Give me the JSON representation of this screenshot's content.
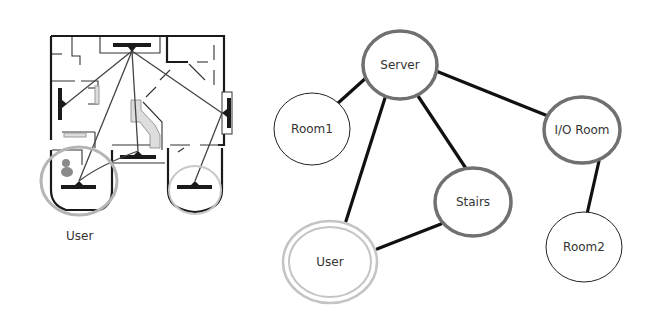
{
  "floorplan": {
    "caption": "User",
    "highlight_color": "#b5b5b5"
  },
  "graph": {
    "nodes": [
      {
        "id": "server",
        "label": "Server",
        "style": "thick-grey",
        "cx": 400,
        "cy": 65,
        "rx": 37,
        "ry": 34
      },
      {
        "id": "room1",
        "label": "Room1",
        "style": "thin-black",
        "cx": 312,
        "cy": 129,
        "rx": 38,
        "ry": 36
      },
      {
        "id": "io_room",
        "label": "I/O Room",
        "style": "thick-grey",
        "cx": 582,
        "cy": 130,
        "rx": 38,
        "ry": 33
      },
      {
        "id": "stairs",
        "label": "Stairs",
        "style": "thick-grey",
        "cx": 473,
        "cy": 202,
        "rx": 38,
        "ry": 34
      },
      {
        "id": "user",
        "label": "User",
        "style": "double-light-grey",
        "cx": 330,
        "cy": 262,
        "rx": 48,
        "ry": 42
      },
      {
        "id": "room2",
        "label": "Room2",
        "style": "thin-black",
        "cx": 584,
        "cy": 247,
        "rx": 38,
        "ry": 35
      }
    ],
    "edges": [
      {
        "from": "server",
        "to": "room1"
      },
      {
        "from": "server",
        "to": "user"
      },
      {
        "from": "server",
        "to": "stairs"
      },
      {
        "from": "server",
        "to": "io_room"
      },
      {
        "from": "stairs",
        "to": "user"
      },
      {
        "from": "io_room",
        "to": "room2"
      }
    ],
    "colors": {
      "edge": "#111111",
      "thick_grey_border": "#707070",
      "thin_black_border": "#222222",
      "user_border": "#c4c4c4"
    }
  }
}
